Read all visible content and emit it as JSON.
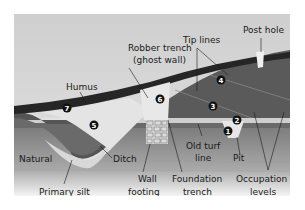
{
  "diagram": {
    "type": "archaeological-section",
    "labels": {
      "robber_trench_1": "Robber trench",
      "robber_trench_2": "(ghost wall)",
      "tip_lines": "Tip lines",
      "post_hole": "Post hole",
      "humus": "Humus",
      "natural": "Natural",
      "ditch": "Ditch",
      "primary_silt": "Primary silt",
      "wall_footing_1": "Wall",
      "wall_footing_2": "footing",
      "foundation_trench_1": "Foundation",
      "foundation_trench_2": "trench",
      "old_turf_line_1": "Old turf",
      "old_turf_line_2": "line",
      "pit": "Pit",
      "occupation_levels_1": "Occupation",
      "occupation_levels_2": "levels"
    },
    "markers": [
      "1",
      "2",
      "3",
      "4",
      "5",
      "6",
      "7"
    ],
    "colors": {
      "sky": "#d4d4d4",
      "humus": "#2b2b2b",
      "fill_dark": "#555555",
      "fill_mid": "#6a6a6a",
      "natural": "#8a8a8a",
      "light": "#e6e6e6",
      "marker": "#111111"
    }
  }
}
